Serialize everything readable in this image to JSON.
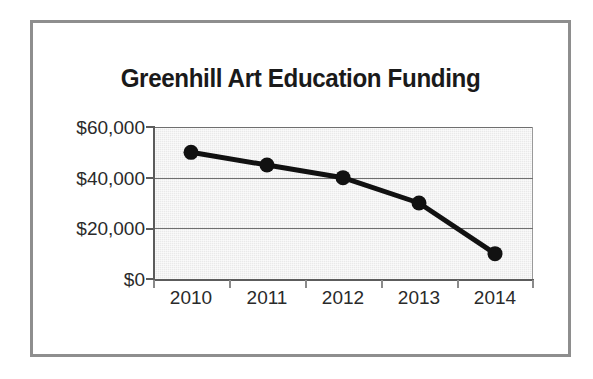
{
  "chart_data": {
    "type": "line",
    "title": "Greenhill Art Education Funding",
    "xlabel": "",
    "ylabel": "",
    "categories": [
      "2010",
      "2011",
      "2012",
      "2013",
      "2014"
    ],
    "values": [
      50000,
      45000,
      40000,
      30000,
      10000
    ],
    "series": [
      {
        "name": "Art Education Funding",
        "values": [
          50000,
          45000,
          40000,
          30000,
          10000
        ]
      }
    ],
    "ylim": [
      0,
      60000
    ],
    "ytick_values": [
      0,
      20000,
      40000,
      60000
    ],
    "ytick_labels": [
      "$0",
      "$20,000",
      "$40,000",
      "$60,000"
    ],
    "xtick_labels": [
      "2010",
      "2011",
      "2012",
      "2013",
      "2014"
    ],
    "grid": true,
    "gridlines_at": [
      20000,
      40000
    ],
    "legend": false,
    "legend_position": "none",
    "marker": "circle",
    "line_color": "#111111",
    "marker_color": "#111111",
    "plot_background": "#e9e9e9",
    "figure_background": "#ffffff",
    "frame_color": "#8e8e8e",
    "axis_color": "#5c5c5c",
    "gridline_color": "#6f6f6f",
    "annotations": []
  }
}
